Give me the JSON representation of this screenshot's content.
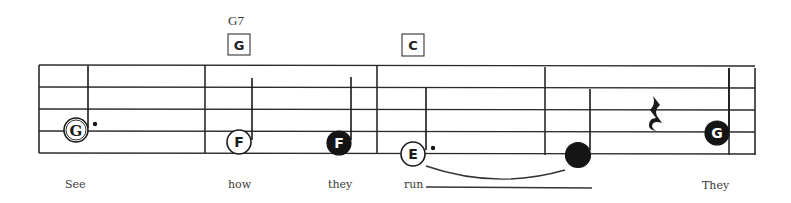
{
  "score": {
    "staff": {
      "left": 39,
      "right": 755,
      "lines_y": [
        65,
        87,
        109,
        131,
        153
      ],
      "barlines_x": [
        39,
        205,
        377,
        545,
        729,
        755
      ]
    },
    "chords": [
      {
        "name": "G7",
        "box_letter": "G",
        "x": 238
      },
      {
        "name": "",
        "box_letter": "C",
        "x": 412
      }
    ],
    "notes": [
      {
        "letter": "G",
        "style": "open-serif",
        "x": 76,
        "y": 130,
        "stem": "up",
        "stem_top": 65,
        "dotted": true,
        "duration": "dotted-half"
      },
      {
        "letter": "F",
        "style": "open",
        "x": 239,
        "y": 142,
        "stem": "up",
        "stem_top": 78,
        "dotted": false,
        "duration": "half"
      },
      {
        "letter": "F",
        "style": "filled",
        "x": 339,
        "y": 143,
        "stem": "up",
        "stem_top": 77,
        "dotted": false,
        "duration": "quarter"
      },
      {
        "letter": "E",
        "style": "open",
        "x": 413,
        "y": 154,
        "stem": "up",
        "stem_top": 88,
        "dotted": true,
        "duration": "dotted-half"
      },
      {
        "letter": "",
        "style": "filled-blank",
        "x": 578,
        "y": 155,
        "stem": "up",
        "stem_top": 89,
        "dotted": false,
        "duration": "quarter"
      },
      {
        "letter": "G",
        "style": "filled",
        "x": 717,
        "y": 133,
        "stem": "up",
        "stem_top": 68,
        "dotted": false,
        "duration": "quarter"
      }
    ],
    "rests": [
      {
        "type": "quarter-rest",
        "x": 652,
        "y": 115
      }
    ],
    "tie": {
      "from_x": 425,
      "to_x": 566,
      "y": 166
    },
    "lyrics": [
      {
        "text": "See",
        "x": 65
      },
      {
        "text": "how",
        "x": 228
      },
      {
        "text": "they",
        "x": 328
      },
      {
        "text": "run",
        "x": 404
      },
      {
        "text": "They",
        "x": 702
      }
    ],
    "lyric_extender": {
      "x1": 426,
      "x2": 592,
      "y": 187
    },
    "lyric_baseline_y": 188
  }
}
